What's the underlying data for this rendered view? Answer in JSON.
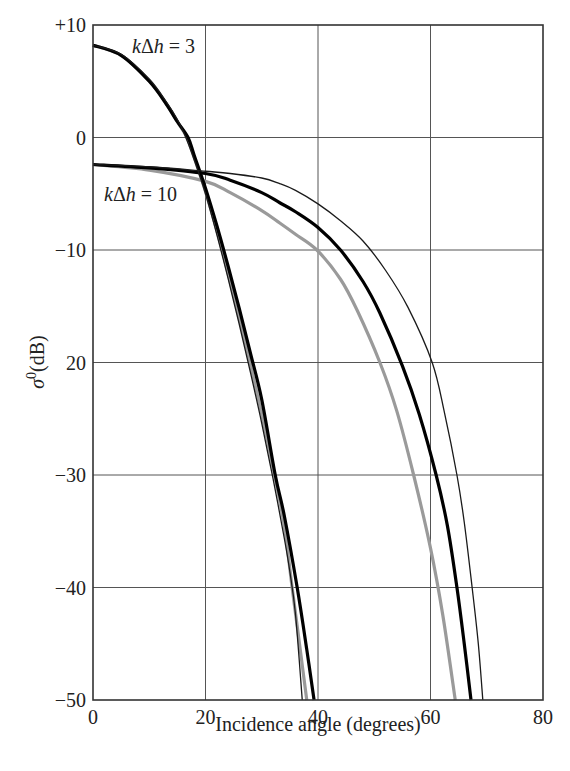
{
  "chart_data": {
    "type": "line",
    "title": "",
    "xlabel": "Incidence angle (degrees)",
    "ylabel": "σ⁰(dB)",
    "ylabel_parts": {
      "symbol": "σ",
      "superscript": "0",
      "unit": "(dB)"
    },
    "xlim": [
      0,
      80
    ],
    "ylim": [
      -50,
      10
    ],
    "x_ticks": [
      0,
      20,
      40,
      60,
      80
    ],
    "x_tick_labels": [
      "0",
      "20",
      "40",
      "60",
      "80"
    ],
    "y_ticks": [
      10,
      0,
      -10,
      -20,
      -30,
      -40,
      -50
    ],
    "y_tick_labels": [
      "+10",
      "0",
      "−10",
      "20",
      "−30",
      "−40",
      "−50"
    ],
    "grid": true,
    "legend": null,
    "annotations": [
      {
        "text_italic": "k",
        "text_mid": "Δ",
        "text_italic2": "h",
        "text_rest": " = 3",
        "full": "kΔh = 3",
        "x_px": 132,
        "y_px": 53
      },
      {
        "text_italic": "k",
        "text_mid": "Δ",
        "text_italic2": "h",
        "text_rest": " = 10",
        "full": "kΔh = 10",
        "x_px": 104,
        "y_px": 201
      }
    ],
    "series": [
      {
        "name": "kΔh = 3 (thin black)",
        "group": "kΔh = 3",
        "style": "thin-black",
        "x": [
          0,
          5,
          10,
          13,
          15,
          16.5,
          18,
          20,
          22,
          24,
          26,
          28,
          30,
          32,
          34,
          35,
          36,
          37.2
        ],
        "y": [
          8.2,
          7.4,
          5.2,
          3.2,
          1.6,
          0,
          -2.0,
          -5.0,
          -8.6,
          -12.5,
          -16.6,
          -20.9,
          -25.4,
          -30.3,
          -35.6,
          -38.6,
          -42.4,
          -50
        ]
      },
      {
        "name": "kΔh = 3 (grey)",
        "group": "kΔh = 3",
        "style": "grey",
        "x": [
          0,
          5,
          10,
          13,
          15,
          16.7,
          18,
          20,
          22,
          24,
          26,
          28,
          30,
          32,
          34,
          35.4,
          36.5,
          38.0
        ],
        "y": [
          8.2,
          7.3,
          5.0,
          3.0,
          1.4,
          0,
          -1.8,
          -4.8,
          -8.2,
          -12.0,
          -16.0,
          -20.2,
          -24.6,
          -29.3,
          -34.5,
          -40,
          -44.2,
          -50
        ]
      },
      {
        "name": "kΔh = 3 (thick black)",
        "group": "kΔh = 3",
        "style": "thick-black",
        "x": [
          0,
          5,
          10,
          13,
          15,
          16.9,
          18,
          20,
          22,
          24,
          26,
          28,
          30,
          32.4,
          34,
          36.3,
          38,
          39.3
        ],
        "y": [
          8.2,
          7.3,
          5.0,
          3.0,
          1.4,
          0,
          -1.6,
          -4.5,
          -7.8,
          -11.4,
          -15.2,
          -19.2,
          -23.3,
          -30,
          -33.6,
          -40,
          -45.5,
          -50
        ]
      },
      {
        "name": "kΔh = 10 (thin black)",
        "group": "kΔh = 10",
        "style": "thin-black",
        "x": [
          0,
          10,
          20,
          24.4,
          30,
          33.2,
          36,
          40,
          44,
          48,
          52,
          56,
          60.3,
          62.5,
          64.7,
          66,
          67.4,
          68.5,
          69.3
        ],
        "y": [
          -2.4,
          -2.6,
          -3.0,
          -3.2,
          -3.6,
          -4.1,
          -4.7,
          -5.9,
          -7.4,
          -9.2,
          -11.8,
          -15.1,
          -20,
          -24.5,
          -30,
          -34.2,
          -40,
          -45.0,
          -50
        ]
      },
      {
        "name": "kΔh = 10 (thick black)",
        "group": "kΔh = 10",
        "style": "thick-black",
        "x": [
          0,
          10,
          20,
          24.4,
          30,
          33.2,
          36,
          40,
          44,
          48,
          51,
          55,
          58,
          61,
          63,
          64.7,
          66,
          67.2
        ],
        "y": [
          -2.4,
          -2.7,
          -3.2,
          -3.8,
          -4.9,
          -5.8,
          -6.6,
          -8.0,
          -10.0,
          -12.8,
          -15.6,
          -20.3,
          -24.6,
          -30,
          -34.5,
          -40,
          -45.0,
          -50
        ]
      },
      {
        "name": "kΔh = 10 (grey)",
        "group": "kΔh = 10",
        "style": "grey",
        "x": [
          0,
          10,
          20,
          24.4,
          30,
          33.2,
          36,
          39.8,
          44,
          47,
          51,
          54,
          57,
          60,
          62.2,
          64.4
        ],
        "y": [
          -2.4,
          -2.9,
          -3.9,
          -4.9,
          -6.5,
          -7.6,
          -8.6,
          -10.0,
          -12.6,
          -15.4,
          -20,
          -24.3,
          -30,
          -36.5,
          -42.5,
          -50
        ]
      }
    ]
  },
  "plot_area_px": {
    "left": 93,
    "top": 25,
    "right": 543,
    "bottom": 700
  },
  "styles": {
    "thin-black": {
      "stroke": "#1a1a1a",
      "width": 1.3
    },
    "thick-black": {
      "stroke": "#000000",
      "width": 3.2
    },
    "grey": {
      "stroke": "#9a9a9a",
      "width": 3.2
    },
    "grid": {
      "stroke": "#555555",
      "width": 1
    },
    "frame": {
      "stroke": "#333333",
      "width": 1.6
    }
  }
}
